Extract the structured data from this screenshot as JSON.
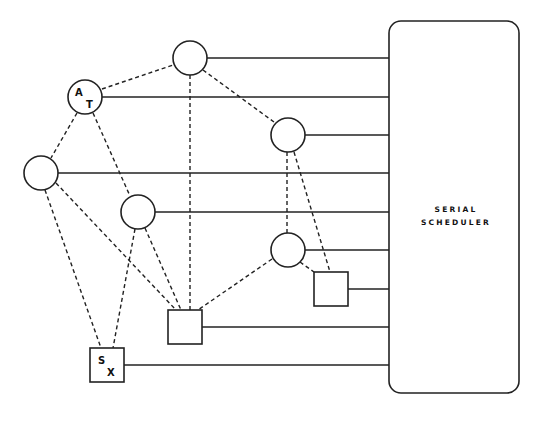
{
  "diagram": {
    "scheduler": {
      "label_line1": "SERIAL",
      "label_line2": "SCHEDULER"
    },
    "nodes": {
      "at": {
        "label_a": "A",
        "label_t": "T"
      },
      "sx": {
        "label_s": "S",
        "label_x": "X"
      }
    },
    "node_list": [
      {
        "id": "c_top",
        "shape": "circle",
        "cx": 190,
        "cy": 58
      },
      {
        "id": "c_at",
        "shape": "circle",
        "cx": 85,
        "cy": 97,
        "labels": [
          "A",
          "T"
        ]
      },
      {
        "id": "c_left",
        "shape": "circle",
        "cx": 41,
        "cy": 173
      },
      {
        "id": "c_mid",
        "shape": "circle",
        "cx": 138,
        "cy": 212
      },
      {
        "id": "c_right1",
        "shape": "circle",
        "cx": 288,
        "cy": 135
      },
      {
        "id": "c_right2",
        "shape": "circle",
        "cx": 288,
        "cy": 250
      },
      {
        "id": "s_right",
        "shape": "square",
        "cx": 331,
        "cy": 290
      },
      {
        "id": "s_mid",
        "shape": "square",
        "cx": 185,
        "cy": 327
      },
      {
        "id": "s_sx",
        "shape": "square",
        "cx": 107,
        "cy": 365,
        "labels": [
          "S",
          "X"
        ]
      }
    ]
  }
}
